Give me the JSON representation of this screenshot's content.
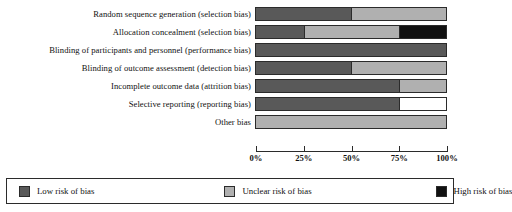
{
  "colors": {
    "low": "#595959",
    "unclear": "#b0b0b0",
    "high": "#111111",
    "empty": "#ffffff",
    "outline": "#2b2b2b"
  },
  "axis": {
    "ticks": [
      {
        "label": "0%",
        "value": 0
      },
      {
        "label": "25%",
        "value": 25
      },
      {
        "label": "50%",
        "value": 50
      },
      {
        "label": "75%",
        "value": 75
      },
      {
        "label": "100%",
        "value": 100
      }
    ]
  },
  "legend": {
    "items": [
      {
        "label": "Low risk of bias",
        "key": "low",
        "color": "#595959"
      },
      {
        "label": "Unclear risk of bias",
        "key": "unclear",
        "color": "#b0b0b0"
      },
      {
        "label": "High risk of bias",
        "key": "high",
        "color": "#111111"
      }
    ]
  },
  "chart_data": {
    "type": "bar",
    "title": "",
    "xlabel": "",
    "ylabel": "",
    "xlim": [
      0,
      100
    ],
    "grid": false,
    "orientation": "horizontal",
    "stacked": true,
    "legend_position": "bottom",
    "categories": [
      "Random sequence generation (selection bias)",
      "Allocation concealment (selection bias)",
      "Blinding of participants and personnel (performance bias)",
      "Blinding of outcome assessment (detection bias)",
      "Incomplete outcome data (attrition bias)",
      "Selective reporting (reporting bias)",
      "Other bias"
    ],
    "series": [
      {
        "name": "Low risk of bias",
        "color": "#595959",
        "values": [
          50,
          25,
          100,
          50,
          75,
          75,
          0
        ]
      },
      {
        "name": "Unclear risk of bias",
        "color": "#b0b0b0",
        "values": [
          50,
          50,
          0,
          50,
          25,
          0,
          100
        ]
      },
      {
        "name": "High risk of bias",
        "color": "#111111",
        "values": [
          0,
          25,
          0,
          0,
          0,
          0,
          0
        ]
      },
      {
        "name": "Not assessed",
        "color": "#ffffff",
        "values": [
          0,
          0,
          0,
          0,
          0,
          25,
          0
        ]
      }
    ],
    "rows": [
      {
        "label": "Random sequence generation (selection bias)",
        "segments": [
          {
            "key": "low",
            "pct": 50,
            "color": "#595959"
          },
          {
            "key": "unclear",
            "pct": 50,
            "color": "#b0b0b0"
          }
        ]
      },
      {
        "label": "Allocation concealment (selection bias)",
        "segments": [
          {
            "key": "low",
            "pct": 25,
            "color": "#595959"
          },
          {
            "key": "unclear",
            "pct": 50,
            "color": "#b0b0b0"
          },
          {
            "key": "high",
            "pct": 25,
            "color": "#111111"
          }
        ]
      },
      {
        "label": "Blinding of participants and personnel (performance bias)",
        "segments": [
          {
            "key": "low",
            "pct": 100,
            "color": "#595959"
          }
        ]
      },
      {
        "label": "Blinding of outcome assessment (detection bias)",
        "segments": [
          {
            "key": "low",
            "pct": 50,
            "color": "#595959"
          },
          {
            "key": "unclear",
            "pct": 50,
            "color": "#b0b0b0"
          }
        ]
      },
      {
        "label": "Incomplete outcome data (attrition bias)",
        "segments": [
          {
            "key": "low",
            "pct": 75,
            "color": "#595959"
          },
          {
            "key": "unclear",
            "pct": 25,
            "color": "#b0b0b0"
          }
        ]
      },
      {
        "label": "Selective reporting (reporting bias)",
        "segments": [
          {
            "key": "low",
            "pct": 75,
            "color": "#595959"
          },
          {
            "key": "empty",
            "pct": 25,
            "color": "#ffffff"
          }
        ]
      },
      {
        "label": "Other bias",
        "segments": [
          {
            "key": "unclear",
            "pct": 100,
            "color": "#b0b0b0"
          }
        ]
      }
    ]
  }
}
